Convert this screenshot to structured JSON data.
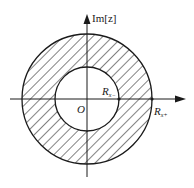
{
  "diagram": {
    "axis_labels": {
      "imag": "Im[z]",
      "origin": "O"
    },
    "radii_labels": {
      "inner": "R",
      "inner_sub": "x−",
      "outer": "R",
      "outer_sub": "x+"
    },
    "region": {
      "type": "annulus",
      "fill": "hatched",
      "inner_radius_px": 32,
      "outer_radius_px": 65
    },
    "colors": {
      "stroke": "#1a1a1a",
      "background": "#ffffff"
    }
  }
}
